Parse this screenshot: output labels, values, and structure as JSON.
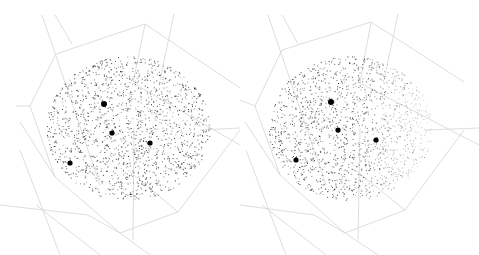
{
  "figure": {
    "type": "stereo-pair 3D point cloud in wireframe polyhedron",
    "background": "#ffffff",
    "edge_color": "#d9d9d9",
    "point_color": "#1a1a1a",
    "marker_color": "#000000"
  },
  "panels": [
    {
      "name": "left-view",
      "x": 0,
      "width": 240,
      "cloud": {
        "cx": 128,
        "cy": 128,
        "rx": 82,
        "ry": 72,
        "count": 1600,
        "seed": 11,
        "fade_right": false
      },
      "markers": [
        {
          "x": 104,
          "y": 104,
          "r": 3
        },
        {
          "x": 112,
          "y": 133,
          "r": 2.6
        },
        {
          "x": 150,
          "y": 143,
          "r": 2.6
        },
        {
          "x": 70,
          "y": 163,
          "r": 2.6
        }
      ],
      "edges": [
        [
          42,
          15,
          100,
          185
        ],
        [
          55,
          15,
          72,
          44
        ],
        [
          56,
          54,
          145,
          24
        ],
        [
          145,
          24,
          240,
          88
        ],
        [
          56,
          54,
          30,
          106
        ],
        [
          30,
          106,
          16,
          106
        ],
        [
          145,
          24,
          133,
          83
        ],
        [
          174,
          14,
          160,
          80
        ],
        [
          30,
          106,
          55,
          177
        ],
        [
          55,
          177,
          120,
          233
        ],
        [
          120,
          233,
          178,
          212
        ],
        [
          178,
          212,
          240,
          130
        ],
        [
          178,
          212,
          128,
          170
        ],
        [
          133,
          83,
          240,
          145
        ],
        [
          20,
          122,
          55,
          177
        ],
        [
          88,
          215,
          120,
          233
        ],
        [
          133,
          240,
          134,
          128
        ],
        [
          36,
          205,
          100,
          255
        ],
        [
          200,
          130,
          240,
          128
        ],
        [
          120,
          233,
          150,
          255
        ],
        [
          20,
          150,
          60,
          255
        ],
        [
          0,
          205,
          88,
          215
        ]
      ]
    },
    {
      "name": "right-view",
      "x": 240,
      "width": 239,
      "cloud": {
        "cx": 110,
        "cy": 128,
        "rx": 82,
        "ry": 72,
        "count": 1600,
        "seed": 23,
        "fade_right": true
      },
      "markers": [
        {
          "x": 91,
          "y": 102,
          "r": 3
        },
        {
          "x": 98,
          "y": 130,
          "r": 2.6
        },
        {
          "x": 136,
          "y": 140,
          "r": 2.6
        },
        {
          "x": 56,
          "y": 160,
          "r": 2.6
        }
      ],
      "edges": [
        [
          28,
          15,
          86,
          185
        ],
        [
          42,
          15,
          58,
          44
        ],
        [
          42,
          50,
          131,
          22
        ],
        [
          131,
          22,
          224,
          82
        ],
        [
          42,
          50,
          15,
          106
        ],
        [
          15,
          106,
          0,
          100
        ],
        [
          131,
          22,
          120,
          83
        ],
        [
          158,
          14,
          144,
          80
        ],
        [
          15,
          106,
          40,
          175
        ],
        [
          40,
          175,
          105,
          233
        ],
        [
          105,
          233,
          165,
          210
        ],
        [
          165,
          210,
          224,
          130
        ],
        [
          165,
          210,
          115,
          170
        ],
        [
          120,
          83,
          239,
          145
        ],
        [
          5,
          122,
          40,
          175
        ],
        [
          74,
          215,
          105,
          233
        ],
        [
          118,
          240,
          120,
          128
        ],
        [
          22,
          205,
          86,
          255
        ],
        [
          185,
          130,
          239,
          128
        ],
        [
          105,
          233,
          138,
          255
        ],
        [
          6,
          150,
          46,
          255
        ],
        [
          0,
          205,
          74,
          215
        ]
      ]
    }
  ]
}
